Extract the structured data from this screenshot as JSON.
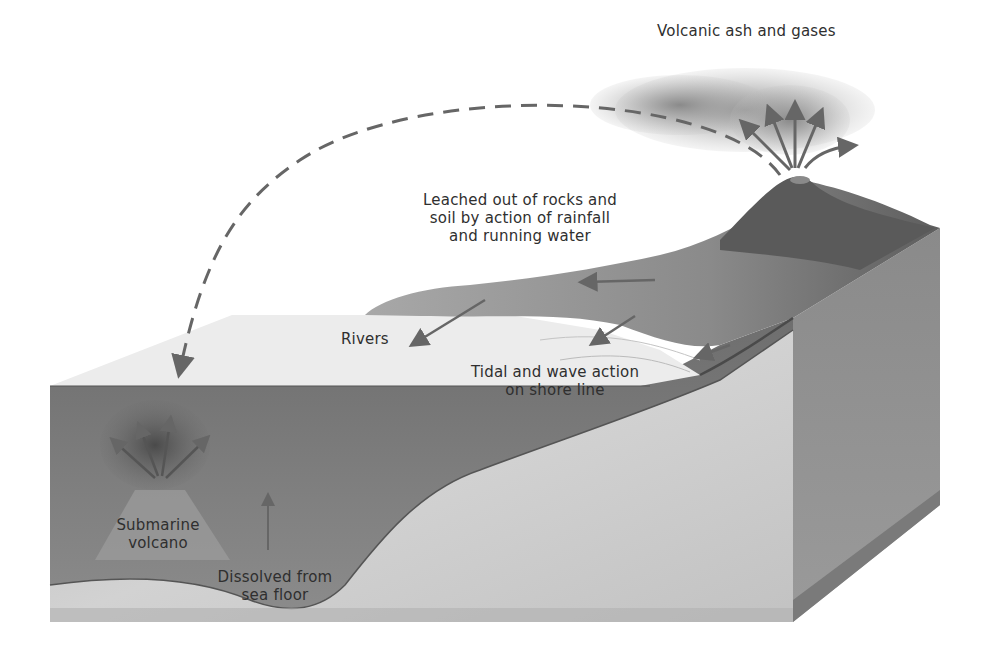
{
  "diagram": {
    "type": "block-diagram",
    "colors": {
      "background": "#ffffff",
      "sea_surface": "#ededed",
      "sea_water_front": "#7a7a7a",
      "continental_crust_front": "#c4c4c4",
      "side_face": "#8e8e8e",
      "land_vegetation": "#8a8a8a",
      "volcano": "#5a5a5a",
      "ash_cloud": "#9a9a9a",
      "arrows": "#666666",
      "text": "#2f2f2f"
    },
    "labels": {
      "volcanic_ash": "Volcanic ash and gases",
      "leached_line1": "Leached out of rocks and",
      "leached_line2": "soil by action of rainfall",
      "leached_line3": "and running water",
      "rivers": "Rivers",
      "tidal_line1": "Tidal and wave action",
      "tidal_line2": "on shore line",
      "submarine_line1": "Submarine",
      "submarine_line2": "volcano",
      "dissolved_line1": "Dissolved from",
      "dissolved_line2": "sea floor"
    }
  }
}
